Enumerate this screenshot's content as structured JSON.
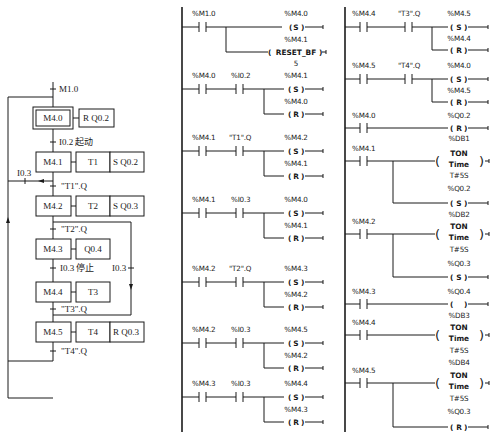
{
  "sfc": {
    "initial_transition": "M1.0",
    "steps": [
      {
        "id": "M4.0",
        "initial": true,
        "actions": [
          "R  Q0.2"
        ]
      },
      {
        "id": "M4.1",
        "actions": [
          "T1",
          "S  Q0.2"
        ]
      },
      {
        "id": "M4.2",
        "actions": [
          "T2",
          "S  Q0.3"
        ]
      },
      {
        "id": "M4.3",
        "actions": [
          "Q0.4"
        ]
      },
      {
        "id": "M4.4",
        "actions": [
          "T3"
        ]
      },
      {
        "id": "M4.5",
        "actions": [
          "T4",
          "R  Q0.3"
        ]
      }
    ],
    "transitions": {
      "t_m40_m41": "I0.2  起动",
      "t_m41_m42": "\"T1\".Q",
      "t_m42_m43": "\"T2\".Q",
      "t_m43_m44": "I0.3  停止",
      "t_m44_m45": "\"T3\".Q",
      "t_m45_m40": "\"T4\".Q",
      "t_m41_m40": "I0.3",
      "t_m42_m45": "I0.3"
    }
  },
  "ladder": {
    "col1": [
      {
        "contacts": [
          "%M1.0"
        ],
        "coils": [
          {
            "addr": "%M4.0",
            "type": "S"
          },
          {
            "addr": "%M4.1",
            "type": "RESET_BF",
            "extra": "5"
          }
        ]
      },
      {
        "contacts": [
          "%M4.0",
          "%I0.2"
        ],
        "coils": [
          {
            "addr": "%M4.1",
            "type": "S"
          },
          {
            "addr": "%M4.0",
            "type": "R"
          }
        ]
      },
      {
        "contacts": [
          "%M4.1",
          "\"T1\".Q"
        ],
        "coils": [
          {
            "addr": "%M4.2",
            "type": "S"
          },
          {
            "addr": "%M4.1",
            "type": "R"
          }
        ]
      },
      {
        "contacts": [
          "%M4.1",
          "%I0.3"
        ],
        "coils": [
          {
            "addr": "%M4.0",
            "type": "S"
          },
          {
            "addr": "%M4.1",
            "type": "R"
          }
        ]
      },
      {
        "contacts": [
          "%M4.2",
          "\"T2\".Q"
        ],
        "coils": [
          {
            "addr": "%M4.3",
            "type": "S"
          },
          {
            "addr": "%M4.2",
            "type": "R"
          }
        ]
      },
      {
        "contacts": [
          "%M4.2",
          "%I0.3"
        ],
        "coils": [
          {
            "addr": "%M4.5",
            "type": "S"
          },
          {
            "addr": "%M4.2",
            "type": "R"
          }
        ]
      },
      {
        "contacts": [
          "%M4.3",
          "%I0.3"
        ],
        "coils": [
          {
            "addr": "%M4.4",
            "type": "S"
          },
          {
            "addr": "%M4.3",
            "type": "R"
          }
        ]
      }
    ],
    "col2": [
      {
        "contacts": [
          "%M4.4",
          "\"T3\".Q"
        ],
        "coils": [
          {
            "addr": "%M4.5",
            "type": "S"
          },
          {
            "addr": "%M4.4",
            "type": "R"
          }
        ]
      },
      {
        "contacts": [
          "%M4.5",
          "\"T4\".Q"
        ],
        "coils": [
          {
            "addr": "%M4.0",
            "type": "S"
          },
          {
            "addr": "%M4.5",
            "type": "R"
          }
        ]
      },
      {
        "contacts": [
          "%M4.0"
        ],
        "coils": [
          {
            "addr": "%Q0.2",
            "type": "R"
          }
        ]
      },
      {
        "contacts": [
          "%M4.1"
        ],
        "timer": {
          "db": "%DB1",
          "type": "TON",
          "sub": "Time",
          "pt": "T#5S"
        },
        "coils": [
          {
            "addr": "%Q0.2",
            "type": "S"
          }
        ]
      },
      {
        "contacts": [
          "%M4.2"
        ],
        "timer": {
          "db": "%DB2",
          "type": "TON",
          "sub": "Time",
          "pt": "T#5S"
        },
        "coils": [
          {
            "addr": "%Q0.3",
            "type": "S"
          }
        ]
      },
      {
        "contacts": [
          "%M4.3"
        ],
        "coils": [
          {
            "addr": "%Q0.4",
            "type": " "
          }
        ]
      },
      {
        "contacts": [
          "%M4.4"
        ],
        "timer": {
          "db": "%DB3",
          "type": "TON",
          "sub": "Time",
          "pt": "T#5S"
        },
        "coils": []
      },
      {
        "contacts": [
          "%M4.5"
        ],
        "timer": {
          "db": "%DB4",
          "type": "TON",
          "sub": "Time",
          "pt": "T#5S"
        },
        "coils": [
          {
            "addr": "%Q0.3",
            "type": "R"
          }
        ]
      }
    ]
  }
}
